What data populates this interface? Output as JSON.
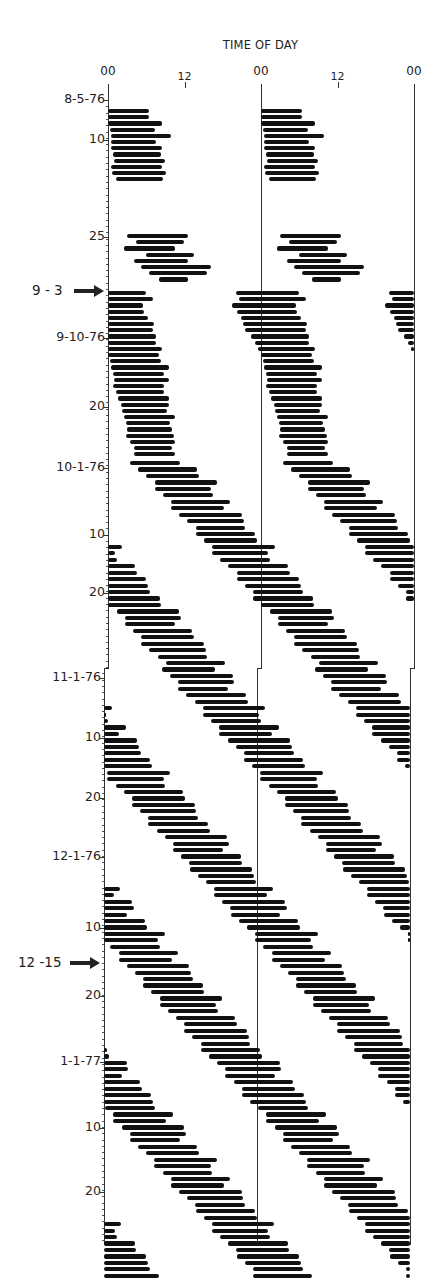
{
  "chart_data": {
    "type": "actogram",
    "title": "TIME OF DAY",
    "xlabel": "TIME OF DAY",
    "ylabel": "",
    "double_plotted": true,
    "x_tick_labels": [
      "00",
      "12",
      "00",
      "12",
      "00"
    ],
    "x_range_hours": [
      0,
      48
    ],
    "y_tick_labels": [
      {
        "label": "8-5-76",
        "y": 100
      },
      {
        "label": "10",
        "y": 140
      },
      {
        "label": "25",
        "y": 237
      },
      {
        "label": "9-10-76",
        "y": 338
      },
      {
        "label": "20",
        "y": 407
      },
      {
        "label": "10-1-76",
        "y": 468
      },
      {
        "label": "10",
        "y": 535
      },
      {
        "label": "20",
        "y": 593
      },
      {
        "label": "11-1-76",
        "y": 678
      },
      {
        "label": "10",
        "y": 738
      },
      {
        "label": "20",
        "y": 798
      },
      {
        "label": "12-1-76",
        "y": 857
      },
      {
        "label": "10",
        "y": 928
      },
      {
        "label": "20",
        "y": 996
      },
      {
        "label": "1-1-77",
        "y": 1062
      },
      {
        "label": "10",
        "y": 1128
      },
      {
        "label": "20",
        "y": 1192
      }
    ],
    "annotations": [
      {
        "label": "9 - 3",
        "y": 291,
        "type": "arrow"
      },
      {
        "label": "12 -15",
        "y": 963,
        "type": "arrow"
      }
    ],
    "segments": [
      {
        "name": "Aug 5-16 1976 (entrained)",
        "start_y": 111,
        "day_spacing": 6.2,
        "days": 12,
        "onset_hr": [
          0.0,
          0.0,
          0.0,
          0.3,
          0.4,
          0.4,
          0.5,
          0.8,
          0.9,
          0.4,
          0.6,
          1.2
        ],
        "duration_hr": [
          6.5,
          6.5,
          8.5,
          7.0,
          9.5,
          7.2,
          8.0,
          7.5,
          8.0,
          8.0,
          8.5,
          7.5
        ]
      },
      {
        "name": "Aug 25-Sep 2 1976",
        "start_y": 236,
        "day_spacing": 6.2,
        "days": 8,
        "onset_hr": [
          3.0,
          4.4,
          2.5,
          6.0,
          4.0,
          5.2,
          6.5,
          8.0
        ],
        "duration_hr": [
          9.5,
          7.5,
          8.0,
          7.5,
          8.5,
          11.0,
          9.0,
          4.5
        ]
      },
      {
        "name": "Sep 3-30 1976 (free-running)",
        "start_y": 293,
        "day_spacing": 6.2,
        "days": 27,
        "onset_hr": [
          -4.0,
          -3.5,
          -4.5,
          -3.8,
          -3.2,
          -2.8,
          -2.5,
          -1.5,
          -1.0,
          -0.5,
          0.0,
          0.3,
          0.5,
          0.8,
          1.0,
          0.8,
          1.3,
          1.5,
          2.0,
          2.2,
          2.5,
          2.8,
          3.0,
          2.8,
          3.5,
          4.0,
          4.0
        ],
        "duration_hr": [
          10.0,
          10.5,
          10.0,
          9.5,
          9.5,
          10.0,
          9.5,
          9.0,
          8.5,
          9.0,
          8.0,
          8.0,
          9.0,
          8.0,
          8.5,
          8.0,
          7.5,
          8.0,
          7.5,
          7.0,
          8.0,
          7.0,
          7.0,
          7.5,
          7.0,
          6.0,
          6.5
        ]
      },
      {
        "name": "Oct 1 1976 - Jan 30 1977 (progressive delay)",
        "start_y": 463,
        "day_spacing": 6.45,
        "days": 127,
        "onset_hr_start": 4.0,
        "delay_per_day_hr": 0.92,
        "duration_hr": 8.8
      }
    ]
  }
}
